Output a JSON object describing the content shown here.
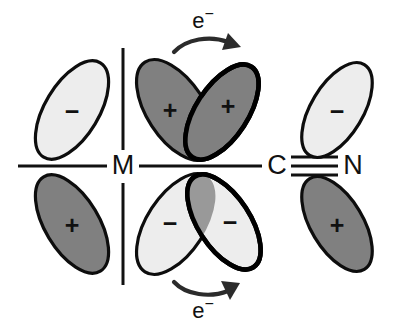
{
  "figure": {
    "background_color": "#ffffff",
    "outline_color": "#0d0d0d"
  },
  "colors": {
    "positive_lobe_fill": "#808080",
    "negative_lobe_fill": "#ededed",
    "overlap_lens_fill": "#999999",
    "line_color": "#111111",
    "arrow_color": "#2b2b2b"
  },
  "atoms": [
    {
      "id": "metal",
      "label": "M",
      "x": 123,
      "y": 166
    },
    {
      "id": "carbon",
      "label": "C",
      "x": 277,
      "y": 166
    },
    {
      "id": "nitrogen",
      "label": "N",
      "x": 352,
      "y": 166
    }
  ],
  "bonds": [
    {
      "id": "metal-carbon-bond",
      "type": "single",
      "order": 1,
      "from": "M",
      "to": "C"
    },
    {
      "id": "carbon-nitrogen-bond",
      "type": "triple",
      "order": 3,
      "from": "C",
      "to": "N"
    }
  ],
  "axes": {
    "horizontal_label": "metal d-orbital horizontal axis",
    "vertical_label": "metal d-orbital vertical axis"
  },
  "orbitals": [
    {
      "id": "metal-lobe-upper-left",
      "group": "metal-d-orbital",
      "sign": "−",
      "shade": "light",
      "fill": "#ededed",
      "cx": 72,
      "cy": 110,
      "rx": 27,
      "ry": 55,
      "rotate": 31
    },
    {
      "id": "metal-lobe-lower-left",
      "group": "metal-d-orbital",
      "sign": "+",
      "shade": "dark",
      "fill": "#808080",
      "cx": 72,
      "cy": 224,
      "rx": 27,
      "ry": 55,
      "rotate": -31
    },
    {
      "id": "metal-lobe-upper-right",
      "group": "metal-d-orbital",
      "sign": "+",
      "shade": "dark",
      "fill": "#808080",
      "cx": 176,
      "cy": 110,
      "rx": 29,
      "ry": 57,
      "rotate": -33
    },
    {
      "id": "metal-lobe-lower-right",
      "group": "metal-d-orbital",
      "sign": "−",
      "shade": "light",
      "fill": "#ededed",
      "cx": 176,
      "cy": 224,
      "rx": 29,
      "ry": 57,
      "rotate": 33
    },
    {
      "id": "ligand-pi-lobe-upper-inner",
      "group": "ligand-pi-star-orbital",
      "sign": "+",
      "shade": "dark",
      "fill": "#808080",
      "cx": 222,
      "cy": 112,
      "rx": 26,
      "ry": 54,
      "rotate": 33
    },
    {
      "id": "ligand-pi-lobe-lower-inner",
      "group": "ligand-pi-star-orbital",
      "sign": "−",
      "shade": "light",
      "fill": "#ededed",
      "cx": 224,
      "cy": 222,
      "rx": 26,
      "ry": 54,
      "rotate": -33
    },
    {
      "id": "ligand-pi-lobe-upper-outer",
      "group": "ligand-pi-star-orbital",
      "sign": "−",
      "shade": "light",
      "fill": "#ededed",
      "cx": 337,
      "cy": 110,
      "rx": 26,
      "ry": 53,
      "rotate": 31
    },
    {
      "id": "ligand-pi-lobe-lower-outer",
      "group": "ligand-pi-star-orbital",
      "sign": "+",
      "shade": "dark",
      "fill": "#808080",
      "cx": 337,
      "cy": 224,
      "rx": 26,
      "ry": 53,
      "rotate": -31
    }
  ],
  "annotations": [
    {
      "id": "electron-flow-top",
      "label": "e−",
      "display": "e",
      "superscript": "−",
      "direction": "left-to-right",
      "curve": "concave-down",
      "x": 204,
      "y": 31
    },
    {
      "id": "electron-flow-bottom",
      "label": "e−",
      "display": "e",
      "superscript": "−",
      "direction": "left-to-right",
      "curve": "concave-up",
      "x": 204,
      "y": 305
    }
  ]
}
